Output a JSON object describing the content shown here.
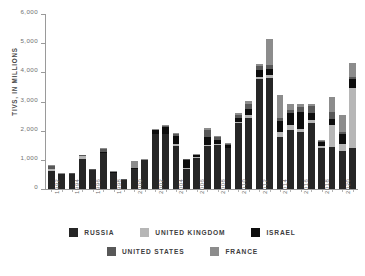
{
  "chart_data": {
    "type": "bar",
    "subtype": "stacked-bar",
    "title": "",
    "xlabel": "",
    "ylabel": "TIVS, IN MILLIONS",
    "ylim": [
      0,
      6000
    ],
    "ytick_values": [
      0,
      1000,
      2000,
      3000,
      4000,
      5000,
      6000
    ],
    "ytick_labels": [
      "0",
      "1,000",
      "2,000",
      "3,000",
      "4,000",
      "5,000",
      "6,000"
    ],
    "grid": false,
    "legend_position": "bottom",
    "categories": [
      "1992",
      "1993",
      "1994",
      "1995",
      "1996",
      "1997",
      "1998",
      "1999",
      "2000",
      "2001",
      "2002",
      "2003",
      "2004",
      "2005",
      "2006",
      "2007",
      "2008",
      "2009",
      "2010",
      "2011",
      "2012",
      "2013",
      "2014",
      "2015",
      "2016",
      "2017",
      "2018",
      "2019",
      "2020",
      "2021"
    ],
    "xtick_labels_shown": [
      "1992",
      "1994",
      "1996",
      "1998",
      "2000",
      "2002",
      "2004",
      "2006",
      "2008",
      "2010",
      "2012",
      "2014",
      "2016",
      "2018",
      "2020"
    ],
    "series": [
      {
        "name": "RUSSIA",
        "color": "#262626",
        "values": [
          620,
          500,
          510,
          1030,
          640,
          1230,
          540,
          300,
          690,
          980,
          1880,
          1870,
          1470,
          700,
          1080,
          1490,
          1500,
          1400,
          2270,
          2450,
          3780,
          3800,
          1790,
          2040,
          1950,
          2250,
          1410,
          1430,
          1300,
          1400
        ]
      },
      {
        "name": "UNITED KINGDOM",
        "color": "#b6b6b6",
        "values": [
          60,
          10,
          10,
          90,
          10,
          20,
          20,
          10,
          10,
          10,
          20,
          30,
          60,
          30,
          20,
          20,
          30,
          20,
          30,
          90,
          60,
          100,
          170,
          140,
          120,
          120,
          70,
          770,
          230,
          2080
        ]
      },
      {
        "name": "ISRAEL",
        "color": "#0d0d0d",
        "values": [
          10,
          10,
          10,
          10,
          10,
          30,
          10,
          10,
          10,
          10,
          120,
          240,
          280,
          260,
          60,
          280,
          150,
          90,
          150,
          190,
          250,
          230,
          380,
          420,
          580,
          240,
          140,
          210,
          360,
          290
        ]
      },
      {
        "name": "UNITED STATES",
        "color": "#585858",
        "values": [
          90,
          10,
          10,
          20,
          20,
          90,
          20,
          20,
          20,
          10,
          20,
          30,
          60,
          30,
          20,
          240,
          90,
          50,
          100,
          180,
          130,
          130,
          80,
          100,
          150,
          240,
          20,
          220,
          60,
          80
        ]
      },
      {
        "name": "FRANCE",
        "color": "#8c8c8c",
        "values": [
          40,
          10,
          10,
          10,
          10,
          20,
          20,
          10,
          220,
          20,
          10,
          10,
          60,
          20,
          30,
          70,
          60,
          20,
          70,
          110,
          60,
          890,
          820,
          220,
          130,
          70,
          30,
          530,
          600,
          470
        ]
      }
    ]
  },
  "legend": {
    "row1": [
      {
        "label": "RUSSIA",
        "color": "#262626"
      },
      {
        "label": "UNITED KINGDOM",
        "color": "#b6b6b6"
      },
      {
        "label": "ISRAEL",
        "color": "#0d0d0d"
      }
    ],
    "row2": [
      {
        "label": "UNITED STATES",
        "color": "#585858"
      },
      {
        "label": "FRANCE",
        "color": "#8c8c8c"
      }
    ]
  }
}
